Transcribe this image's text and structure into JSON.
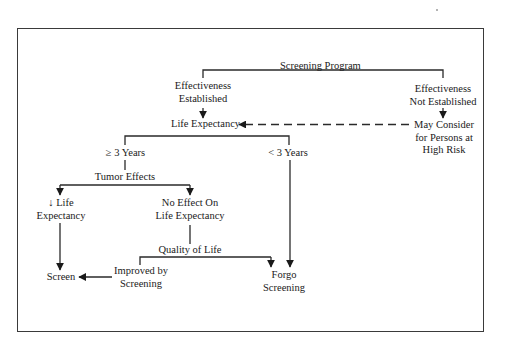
{
  "diagram": {
    "type": "flowchart",
    "nodes": {
      "screening_program": {
        "lines": [
          "Screening Program"
        ]
      },
      "effectiveness_established": {
        "lines": [
          "Effectiveness",
          "Established"
        ]
      },
      "effectiveness_not_established": {
        "lines": [
          "Effectiveness",
          "Not Established"
        ]
      },
      "life_expectancy": {
        "lines": [
          "Life Expectancy"
        ]
      },
      "may_consider": {
        "lines": [
          "May Consider",
          "for Persons at",
          "High Risk"
        ]
      },
      "gte_3_years": {
        "lines": [
          "≥ 3 Years"
        ]
      },
      "lt_3_years": {
        "lines": [
          "< 3 Years"
        ]
      },
      "tumor_effects": {
        "lines": [
          "Tumor Effects"
        ]
      },
      "decreased_life_expectancy": {
        "lines": [
          "↓ Life",
          "Expectancy"
        ]
      },
      "no_effect": {
        "lines": [
          "No Effect On",
          "Life Expectancy"
        ]
      },
      "quality_of_life": {
        "lines": [
          "Quality of Life"
        ]
      },
      "improved_by_screening": {
        "lines": [
          "Improved by",
          "Screening"
        ]
      },
      "screen": {
        "lines": [
          "Screen"
        ]
      },
      "forgo_screening": {
        "lines": [
          "Forgo",
          "Screening"
        ]
      }
    },
    "edges": [
      {
        "from": "screening_program",
        "to": "effectiveness_established",
        "style": "solid",
        "arrow": false
      },
      {
        "from": "screening_program",
        "to": "effectiveness_not_established",
        "style": "solid",
        "arrow": false
      },
      {
        "from": "effectiveness_established",
        "to": "life_expectancy",
        "style": "solid",
        "arrow": true
      },
      {
        "from": "effectiveness_not_established",
        "to": "may_consider",
        "style": "solid",
        "arrow": true
      },
      {
        "from": "may_consider",
        "to": "life_expectancy",
        "style": "dashed",
        "arrow": true
      },
      {
        "from": "life_expectancy",
        "to": "gte_3_years",
        "style": "solid",
        "arrow": false
      },
      {
        "from": "life_expectancy",
        "to": "lt_3_years",
        "style": "solid",
        "arrow": false
      },
      {
        "from": "gte_3_years",
        "to": "tumor_effects",
        "style": "solid",
        "arrow": false
      },
      {
        "from": "tumor_effects",
        "to": "decreased_life_expectancy",
        "style": "solid",
        "arrow": true
      },
      {
        "from": "tumor_effects",
        "to": "no_effect",
        "style": "solid",
        "arrow": true
      },
      {
        "from": "decreased_life_expectancy",
        "to": "screen",
        "style": "solid",
        "arrow": true
      },
      {
        "from": "no_effect",
        "to": "quality_of_life",
        "style": "solid",
        "arrow": false
      },
      {
        "from": "quality_of_life",
        "to": "improved_by_screening",
        "style": "solid",
        "arrow": false
      },
      {
        "from": "quality_of_life",
        "to": "forgo_screening",
        "style": "solid",
        "arrow": true
      },
      {
        "from": "improved_by_screening",
        "to": "screen",
        "style": "solid",
        "arrow": true
      },
      {
        "from": "lt_3_years",
        "to": "forgo_screening",
        "style": "solid",
        "arrow": true
      }
    ]
  },
  "colors": {
    "line": "#2a2a2a",
    "text": "#1a1a1a",
    "frame": "#3a3a3a",
    "background": "#ffffff"
  }
}
